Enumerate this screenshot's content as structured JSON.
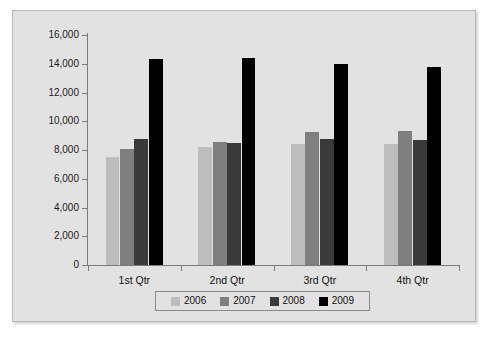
{
  "page": {
    "top_cut_text": ""
  },
  "chart_data": {
    "type": "bar",
    "title": "",
    "subtitle": "",
    "xlabel": "",
    "ylabel": "",
    "categories": [
      "1st Qtr",
      "2nd Qtr",
      "3rd Qtr",
      "4th Qtr"
    ],
    "series": [
      {
        "name": "2006",
        "color": "#bdbdbd",
        "values": [
          7500,
          8200,
          8450,
          8400
        ]
      },
      {
        "name": "2007",
        "color": "#7f7f7f",
        "values": [
          8100,
          8550,
          9250,
          9350
        ]
      },
      {
        "name": "2008",
        "color": "#3a3a3a",
        "values": [
          8800,
          8500,
          8800,
          8700
        ]
      },
      {
        "name": "2009",
        "color": "#000000",
        "values": [
          14350,
          14400,
          14000,
          13800
        ]
      }
    ],
    "ylim": [
      0,
      16000
    ],
    "ytick_step": 2000,
    "ytick_labels": [
      "0",
      "2,000",
      "4,000",
      "6,000",
      "8,000",
      "10,000",
      "12,000",
      "14,000",
      "16,000"
    ],
    "ytick_values": [
      0,
      2000,
      4000,
      6000,
      8000,
      10000,
      12000,
      14000,
      16000
    ],
    "grid": false,
    "legend_position": "bottom",
    "plot_background": "#e2e2e2",
    "axis_color": "#7b7b7b",
    "text_color": "#111111"
  }
}
